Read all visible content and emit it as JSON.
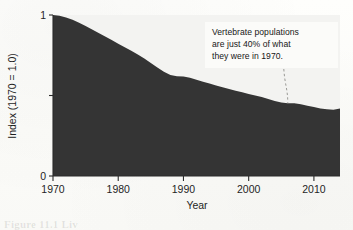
{
  "figure": {
    "caption_remnant": "Figure 11.1 Liv"
  },
  "annotation": {
    "name": "vertebrate-population-callout",
    "line1": "Vertebrate populations",
    "line2": "are just 40% of what",
    "line3": "they were in 1970.",
    "full_text": "Vertebrate populations are just 40% of what they were in 1970.",
    "box_fill": "#fbfbf9",
    "leader_color": "#9a9a96"
  },
  "chart_data": {
    "type": "area",
    "title": "",
    "subtitle": "",
    "xlabel": "Year",
    "ylabel": "Index (1970 = 1.0)",
    "xlim": [
      1970,
      2014
    ],
    "ylim": [
      0,
      1
    ],
    "xticks": [
      1970,
      1980,
      1990,
      2000,
      2010
    ],
    "xticklabels": [
      "1970",
      "1980",
      "1990",
      "2000",
      "2010"
    ],
    "yticks": [
      0,
      0.5,
      1
    ],
    "yticklabels": [
      "0",
      "",
      "1"
    ],
    "grid": false,
    "legend": null,
    "series_name": "Living Planet Index (vertebrate populations)",
    "fill_color": "#343434",
    "plot_background": "#f3f3f1",
    "x": [
      1970,
      1971,
      1972,
      1973,
      1974,
      1975,
      1976,
      1977,
      1978,
      1979,
      1980,
      1981,
      1982,
      1983,
      1984,
      1985,
      1986,
      1987,
      1988,
      1989,
      1990,
      1991,
      1992,
      1993,
      1994,
      1995,
      1996,
      1997,
      1998,
      1999,
      2000,
      2001,
      2002,
      2003,
      2004,
      2005,
      2006,
      2007,
      2008,
      2009,
      2010,
      2011,
      2012,
      2013,
      2014
    ],
    "values": [
      1.0,
      0.995,
      0.985,
      0.97,
      0.952,
      0.932,
      0.91,
      0.888,
      0.866,
      0.844,
      0.822,
      0.8,
      0.778,
      0.755,
      0.73,
      0.702,
      0.674,
      0.648,
      0.628,
      0.62,
      0.618,
      0.61,
      0.598,
      0.586,
      0.574,
      0.562,
      0.551,
      0.54,
      0.53,
      0.52,
      0.51,
      0.5,
      0.49,
      0.478,
      0.466,
      0.456,
      0.452,
      0.452,
      0.446,
      0.436,
      0.428,
      0.42,
      0.414,
      0.412,
      0.42
    ],
    "annotation_target": {
      "x": 2006,
      "y": 0.452
    }
  }
}
